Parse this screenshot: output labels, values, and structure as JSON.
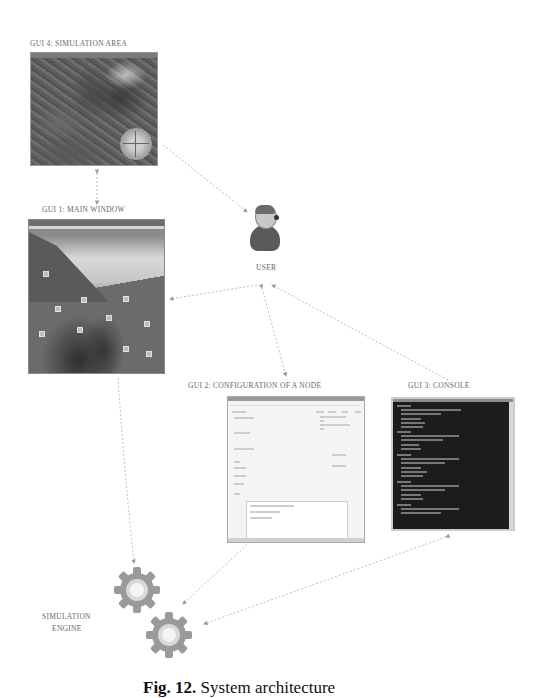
{
  "diagram": {
    "labels": {
      "gui4": "GUI 4: SIMULATION AREA",
      "gui1": "GUI 1: MAIN WINDOW",
      "gui2": "GUI 2: CONFIGURATION OF A NODE",
      "gui3": "GUI 3: CONSOLE",
      "user": "USER",
      "engine_line1": "SIMULATION",
      "engine_line2": "ENGINE"
    },
    "caption": {
      "prefix": "Fig. 12.",
      "text": "System architecture"
    },
    "nodes": [
      {
        "id": "gui4",
        "name": "Simulation Area",
        "icon": "map-screenshot"
      },
      {
        "id": "gui1",
        "name": "Main Window",
        "icon": "window-screenshot"
      },
      {
        "id": "gui2",
        "name": "Configuration of a Node",
        "icon": "form-screenshot"
      },
      {
        "id": "gui3",
        "name": "Console",
        "icon": "terminal-screenshot"
      },
      {
        "id": "user",
        "name": "User",
        "icon": "user-headset-icon"
      },
      {
        "id": "engine",
        "name": "Simulation Engine",
        "icon": "gears-icon"
      }
    ],
    "edges": [
      {
        "from": "gui4",
        "to": "gui1",
        "style": "dashed",
        "bidirectional": true
      },
      {
        "from": "gui4",
        "to": "user",
        "style": "dashed"
      },
      {
        "from": "user",
        "to": "gui1",
        "style": "dashed"
      },
      {
        "from": "user",
        "to": "gui2",
        "style": "dashed",
        "bidirectional": true
      },
      {
        "from": "gui3",
        "to": "user",
        "style": "dashed"
      },
      {
        "from": "gui1",
        "to": "engine",
        "style": "dashed"
      },
      {
        "from": "gui2",
        "to": "engine",
        "style": "dashed",
        "bidirectional": true
      },
      {
        "from": "gui3",
        "to": "engine",
        "style": "dashed",
        "bidirectional": true
      }
    ],
    "colors": {
      "arrow": "#b0b0b0",
      "gear": "#9a9a9a",
      "console_bg": "#1c1c1c"
    }
  }
}
